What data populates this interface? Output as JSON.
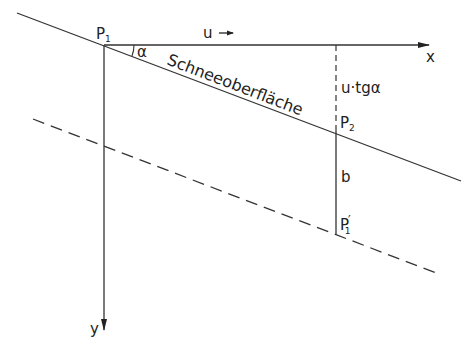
{
  "diagram": {
    "colors": {
      "ink": "#333333",
      "background": "#ffffff"
    },
    "labels": {
      "p1": "P",
      "p1_sub": "1",
      "u_arrow": "u",
      "x_axis": "x",
      "y_axis": "y",
      "alpha": "α",
      "snow_surface": "Schneeoberfläche",
      "u_tg_alpha": "u·tgα",
      "p2": "P",
      "p2_sub": "2",
      "b": "b",
      "p1_prime": "P",
      "p1_prime_sub": "1",
      "p1_prime_mark": "′"
    },
    "geometry": {
      "snow_line": {
        "x1": 17,
        "y1": 13,
        "x2": 461,
        "y2": 181
      },
      "dashed_line": {
        "x1": 33,
        "y1": 119,
        "x2": 439,
        "y2": 274
      },
      "x_axis": {
        "x1": 104,
        "y1": 45,
        "x2": 429,
        "y2": 45
      },
      "y_axis": {
        "x1": 104,
        "y1": 45,
        "x2": 104,
        "y2": 330
      },
      "vertical_dashed": {
        "x": 336,
        "y1": 45,
        "y2": 131
      },
      "vertical_solid": {
        "x": 336,
        "y1": 131,
        "y2": 234
      }
    }
  }
}
